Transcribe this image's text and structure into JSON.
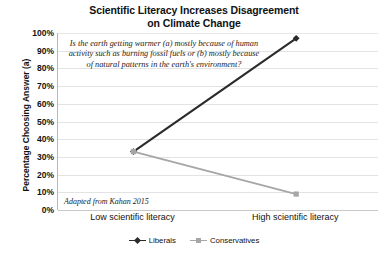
{
  "chart_data": {
    "type": "line",
    "title": "Scientific Literacy Increases Disagreement on Climate Change",
    "title_line1": "Scientific Literacy Increases Disagreement",
    "title_line2": "on Climate Change",
    "xlabel": "",
    "ylabel": "Percentage Choosing Answer (a)",
    "categories": [
      "Low scientific literacy",
      "High scientific literacy"
    ],
    "ylim": [
      0,
      100
    ],
    "ytick_labels": [
      "0%",
      "10%",
      "20%",
      "30%",
      "40%",
      "50%",
      "60%",
      "70%",
      "80%",
      "90%",
      "100%"
    ],
    "ytick_values": [
      0,
      10,
      20,
      30,
      40,
      50,
      60,
      70,
      80,
      90,
      100
    ],
    "grid": true,
    "legend_position": "bottom-center",
    "series": [
      {
        "name": "Liberals",
        "values": [
          33,
          97
        ],
        "color": "#2b2b2b",
        "marker": "diamond"
      },
      {
        "name": "Conservatives",
        "values": [
          33,
          9
        ],
        "color": "#a6a6a6",
        "marker": "square"
      }
    ],
    "annotations": [
      {
        "name": "survey-question",
        "text": "Is the earth getting warmer (a) mostly because of human activity such as burning fossil fuels or (b) mostly because of natural patterns in the earth's environment?"
      },
      {
        "name": "source-note",
        "text": "Adapted from Kahan 2015"
      }
    ]
  },
  "colors": {
    "liberals": "#2b2b2b",
    "conservatives": "#a6a6a6",
    "gridline": "#e3e3e3",
    "axis": "#b8b8b8",
    "text": "#111111",
    "background": "#ffffff"
  }
}
